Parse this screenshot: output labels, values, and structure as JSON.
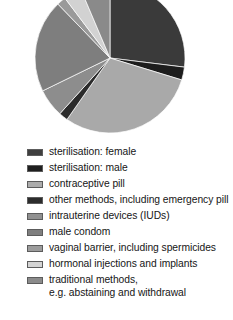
{
  "chart_data": {
    "type": "pie",
    "title": "",
    "xlabel": "",
    "ylabel": "",
    "legend_position": "bottom",
    "grid": false,
    "categories": [
      "sterilisation: female",
      "sterilisation: male",
      "contraceptive pill",
      "other methods, including emergency pill",
      "intrauterine devices (IUDs)",
      "male condom",
      "vaginal barrier, including spermicides",
      "hormonal injections and implants",
      "traditional methods,\ne.g. abstaining and withdrawal"
    ],
    "values": [
      27,
      3,
      30,
      2,
      6,
      20,
      2,
      4,
      6
    ],
    "colors": [
      "#3a3a3a",
      "#1d1d1d",
      "#a9a9a9",
      "#2b2b2b",
      "#8d8d8d",
      "#7e7e7e",
      "#9a9a9a",
      "#d2d2d2",
      "#8a8a8a"
    ],
    "start_angle": 0,
    "slice_angles_deg": [
      97,
      10,
      108,
      7,
      22,
      72,
      7,
      14,
      23
    ],
    "center": {
      "x": 110,
      "y": 58
    },
    "radius": 75
  },
  "legend": {
    "items": [
      {
        "label": "sterilisation: female",
        "color": "#3f3f3f"
      },
      {
        "label": "sterilisation: male",
        "color": "#1f1f1f"
      },
      {
        "label": "contraceptive pill",
        "color": "#acacac"
      },
      {
        "label": "other methods, including emergency pill",
        "color": "#2c2c2c"
      },
      {
        "label": "intrauterine devices (IUDs)",
        "color": "#909090"
      },
      {
        "label": "male condom",
        "color": "#7f7f7f"
      },
      {
        "label": "vaginal barrier, including spermicides",
        "color": "#9c9c9c"
      },
      {
        "label": "hormonal injections and implants",
        "color": "#d4d4d4"
      },
      {
        "label": "traditional methods,\ne.g. abstaining and withdrawal",
        "color": "#8b8b8b"
      }
    ]
  }
}
